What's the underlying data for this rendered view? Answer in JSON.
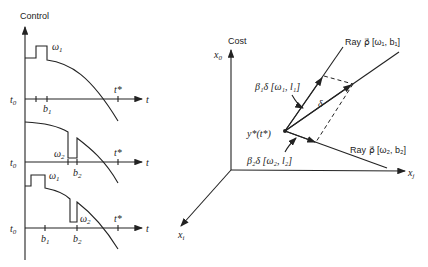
{
  "left_panel": {
    "y_axis_label": "Control",
    "t_axis_label": "t",
    "t0_label": "t",
    "t0_sub": "0",
    "tstar_label": "t*",
    "plots": [
      {
        "name": "perturbation-1",
        "ticks": [
          "b1"
        ],
        "pulse_label": "ω",
        "pulse_sub": "1",
        "b_label": "b",
        "b_sub": "1"
      },
      {
        "name": "perturbation-2",
        "ticks": [
          "b2"
        ],
        "pulse_label": "ω",
        "pulse_sub": "2",
        "b_label": "b",
        "b_sub": "2"
      },
      {
        "name": "combined",
        "ticks": [
          "b1",
          "b2"
        ],
        "pulse1_label": "ω",
        "pulse1_sub": "1",
        "pulse2_label": "ω",
        "pulse2_sub": "2",
        "b1_label": "b",
        "b1_sub": "1",
        "b2_label": "b",
        "b2_sub": "2"
      }
    ]
  },
  "right_panel": {
    "cost_label": "Cost",
    "x0_label": "x",
    "x0_sub": "0",
    "xj_label": "x",
    "xj_sub": "j",
    "xi_label": "x",
    "xi_sub": "i",
    "ray1_label": "Ray ρ⃗ [ω₁, b₁]",
    "ray2_label": "Ray ρ⃗ [ω₂, b₂]",
    "beta1_label": "β₁δ [ω₁, l₁]",
    "beta2_label": "β₂δ [ω₂, l₂]",
    "delta_label": "δ",
    "point_label": "y*(t*)"
  }
}
